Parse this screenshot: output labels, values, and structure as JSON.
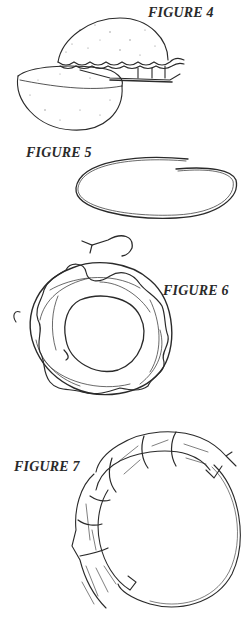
{
  "figures": [
    {
      "label": "FIGURE 4",
      "subject": "two dome-shaped foam halves beside fluted tart pan"
    },
    {
      "label": "FIGURE 5",
      "subject": "open oval wire ring"
    },
    {
      "label": "FIGURE 6",
      "subject": "wrapped vine wreath with bent wire hook"
    },
    {
      "label": "FIGURE 7",
      "subject": "bundles of straw bound to wire ring"
    }
  ],
  "colors": {
    "ink": "#2a2a2a",
    "background": "#ffffff"
  }
}
